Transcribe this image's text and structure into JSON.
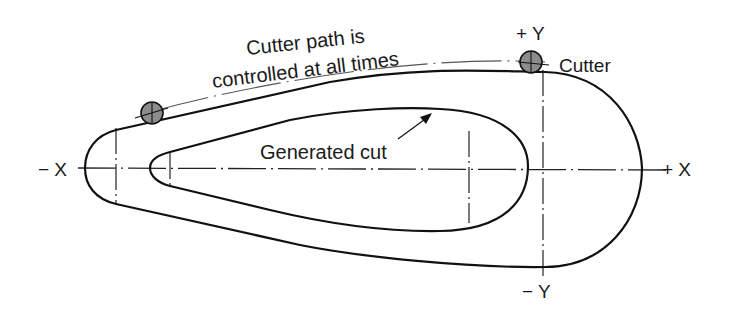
{
  "diagram": {
    "labels": {
      "cutter_path_line1": "Cutter path is",
      "cutter_path_line2": "controlled at all times",
      "cutter": "Cutter",
      "generated_cut": "Generated cut",
      "plus_y": "+ Y",
      "minus_y": "− Y",
      "plus_x": "+ X",
      "minus_x": "− X"
    },
    "elements": {
      "outer_profile": "cutter centerline path (outer teardrop)",
      "inner_profile": "generated cut (inner teardrop)",
      "cutters": [
        "cutter-left",
        "cutter-top-right"
      ],
      "axes": [
        "x-axis-centerline",
        "y-axis-centerline"
      ]
    },
    "colors": {
      "line": "#111111",
      "cutter_fill": "#8c8c8c",
      "background": "#ffffff"
    }
  }
}
